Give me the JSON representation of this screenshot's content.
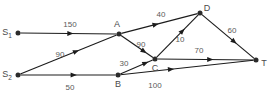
{
  "diagram": {
    "stroke_color": "#1c1c1c",
    "node_color": "#2b2b2b",
    "label_color": "#4a4a4a",
    "weight_color": "#5a5a5a",
    "background": "#ffffff"
  },
  "nodes": [
    {
      "id": "S1",
      "label": "S",
      "sub": "1",
      "x": 18,
      "y": 33,
      "label_x": 7,
      "label_y": 33
    },
    {
      "id": "S2",
      "label": "S",
      "sub": "2",
      "x": 18,
      "y": 75,
      "label_x": 7,
      "label_y": 75
    },
    {
      "id": "A",
      "label": "A",
      "sub": "",
      "x": 119,
      "y": 34,
      "label_x": 117,
      "label_y": 25
    },
    {
      "id": "B",
      "label": "B",
      "sub": "",
      "x": 118,
      "y": 75,
      "label_x": 118,
      "label_y": 85
    },
    {
      "id": "C",
      "label": "C",
      "sub": "",
      "x": 155,
      "y": 59,
      "label_x": 155,
      "label_y": 69
    },
    {
      "id": "D",
      "label": "D",
      "sub": "",
      "x": 200,
      "y": 13,
      "label_x": 207,
      "label_y": 9
    },
    {
      "id": "T",
      "label": "T",
      "sub": "",
      "x": 256,
      "y": 60,
      "label_x": 264,
      "label_y": 64
    }
  ],
  "edges": [
    {
      "from": "S1",
      "to": "A",
      "weight": "150",
      "label_x": 70,
      "label_y": 25,
      "arrow_t": 0.52
    },
    {
      "from": "S2",
      "to": "A",
      "weight": "90",
      "label_x": 60,
      "label_y": 55,
      "arrow_t": 0.58
    },
    {
      "from": "S2",
      "to": "B",
      "weight": "50",
      "label_x": 70,
      "label_y": 88,
      "arrow_t": 0.56
    },
    {
      "from": "A",
      "to": "D",
      "weight": "40",
      "label_x": 161,
      "label_y": 15,
      "arrow_t": 0.45
    },
    {
      "from": "A",
      "to": "C",
      "weight": "90",
      "label_x": 141,
      "label_y": 45,
      "arrow_t": 0.72
    },
    {
      "from": "B",
      "to": "C",
      "weight": "30",
      "label_x": 124,
      "label_y": 64,
      "arrow_t": 0.78
    },
    {
      "from": "B",
      "to": "T",
      "weight": "100",
      "label_x": 155,
      "label_y": 86,
      "arrow_t": 0.38
    },
    {
      "from": "C",
      "to": "D",
      "weight": "10",
      "label_x": 180,
      "label_y": 40,
      "arrow_t": 0.62
    },
    {
      "from": "C",
      "to": "T",
      "weight": "70",
      "label_x": 199,
      "label_y": 51,
      "arrow_t": 0.55
    },
    {
      "from": "D",
      "to": "T",
      "weight": "60",
      "label_x": 232,
      "label_y": 31,
      "arrow_t": 0.62
    }
  ]
}
